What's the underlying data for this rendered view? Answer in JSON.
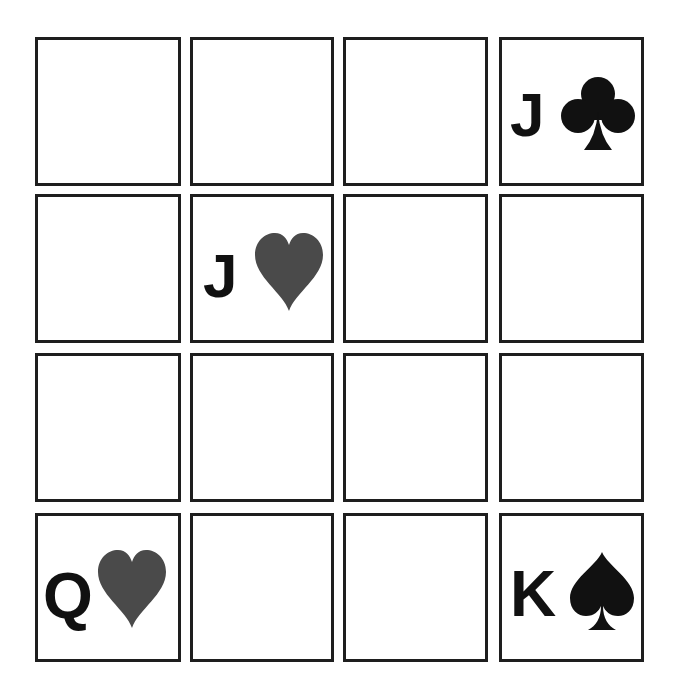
{
  "board": {
    "rows": 4,
    "cols": 4,
    "border_color": "#1e1e1e",
    "col_x": [
      35,
      190,
      343,
      499
    ],
    "col_w": [
      146,
      144,
      145,
      145
    ],
    "row_y": [
      37,
      194,
      353,
      513
    ],
    "row_h": [
      149,
      149,
      149,
      149
    ]
  },
  "cells": [
    {
      "row": 0,
      "col": 0,
      "card": null
    },
    {
      "row": 0,
      "col": 1,
      "card": null
    },
    {
      "row": 0,
      "col": 2,
      "card": null
    },
    {
      "row": 0,
      "col": 3,
      "card": {
        "rank": "J",
        "suit": "clubs",
        "suit_color": "#111111"
      }
    },
    {
      "row": 1,
      "col": 0,
      "card": null
    },
    {
      "row": 1,
      "col": 1,
      "card": {
        "rank": "J",
        "suit": "hearts",
        "suit_color": "#4a4a4a"
      }
    },
    {
      "row": 1,
      "col": 2,
      "card": null
    },
    {
      "row": 1,
      "col": 3,
      "card": null
    },
    {
      "row": 2,
      "col": 0,
      "card": null
    },
    {
      "row": 2,
      "col": 1,
      "card": null
    },
    {
      "row": 2,
      "col": 2,
      "card": null
    },
    {
      "row": 2,
      "col": 3,
      "card": null
    },
    {
      "row": 3,
      "col": 0,
      "card": {
        "rank": "Q",
        "suit": "hearts",
        "suit_color": "#4a4a4a"
      }
    },
    {
      "row": 3,
      "col": 1,
      "card": null
    },
    {
      "row": 3,
      "col": 2,
      "card": null
    },
    {
      "row": 3,
      "col": 3,
      "card": {
        "rank": "K",
        "suit": "spades",
        "suit_color": "#111111"
      }
    }
  ],
  "labels": {
    "r0c3_rank": "J",
    "r1c1_rank": "J",
    "r3c0_rank": "Q",
    "r3c3_rank": "K"
  }
}
